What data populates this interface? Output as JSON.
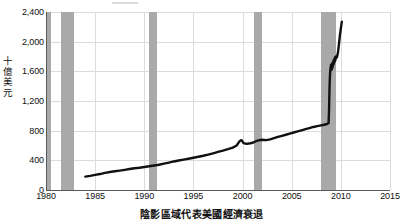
{
  "chart_data": {
    "type": "line",
    "title": "",
    "subtitle": "",
    "xlabel": "",
    "ylabel": "十億美元",
    "caption": "陰影區域代表美國經濟衰退",
    "legend_label": "",
    "legend_position": "top",
    "grid": true,
    "xlim": [
      1980,
      2015
    ],
    "ylim": [
      0,
      2400
    ],
    "xticks": [
      "1980",
      "1985",
      "1990",
      "1995",
      "2000",
      "2005",
      "2010",
      "2015"
    ],
    "xtick_values": [
      1980,
      1985,
      1990,
      1995,
      2000,
      2005,
      2010,
      2015
    ],
    "yticks": [
      "0",
      "400",
      "800",
      "1,200",
      "1,600",
      "2,000",
      "2,400"
    ],
    "ytick_values": [
      0,
      400,
      800,
      1200,
      1600,
      2000,
      2400
    ],
    "series": [
      {
        "name": "",
        "color": "#111111",
        "points": [
          [
            1984.0,
            180
          ],
          [
            1984.5,
            190
          ],
          [
            1985.0,
            203
          ],
          [
            1985.5,
            215
          ],
          [
            1986.0,
            230
          ],
          [
            1986.5,
            243
          ],
          [
            1987.0,
            253
          ],
          [
            1987.5,
            262
          ],
          [
            1988.0,
            272
          ],
          [
            1988.5,
            283
          ],
          [
            1989.0,
            293
          ],
          [
            1989.5,
            300
          ],
          [
            1990.0,
            310
          ],
          [
            1990.5,
            320
          ],
          [
            1991.0,
            330
          ],
          [
            1991.5,
            340
          ],
          [
            1992.0,
            355
          ],
          [
            1992.5,
            370
          ],
          [
            1993.0,
            385
          ],
          [
            1993.5,
            398
          ],
          [
            1994.0,
            410
          ],
          [
            1994.5,
            422
          ],
          [
            1995.0,
            435
          ],
          [
            1995.5,
            448
          ],
          [
            1996.0,
            462
          ],
          [
            1996.5,
            478
          ],
          [
            1997.0,
            495
          ],
          [
            1997.5,
            513
          ],
          [
            1998.0,
            530
          ],
          [
            1998.5,
            550
          ],
          [
            1999.0,
            572
          ],
          [
            1999.4,
            600
          ],
          [
            1999.7,
            660
          ],
          [
            1999.9,
            672
          ],
          [
            2000.1,
            632
          ],
          [
            2000.4,
            622
          ],
          [
            2000.8,
            630
          ],
          [
            2001.1,
            640
          ],
          [
            2001.4,
            660
          ],
          [
            2001.7,
            672
          ],
          [
            2002.0,
            678
          ],
          [
            2002.4,
            672
          ],
          [
            2002.8,
            683
          ],
          [
            2003.2,
            700
          ],
          [
            2003.6,
            716
          ],
          [
            2004.0,
            730
          ],
          [
            2004.4,
            745
          ],
          [
            2004.8,
            760
          ],
          [
            2005.2,
            775
          ],
          [
            2005.6,
            790
          ],
          [
            2006.0,
            805
          ],
          [
            2006.4,
            820
          ],
          [
            2006.8,
            835
          ],
          [
            2007.2,
            850
          ],
          [
            2007.6,
            862
          ],
          [
            2008.0,
            872
          ],
          [
            2008.3,
            880
          ],
          [
            2008.6,
            890
          ],
          [
            2008.75,
            900
          ],
          [
            2008.8,
            1080
          ],
          [
            2008.85,
            1400
          ],
          [
            2008.9,
            1570
          ],
          [
            2008.95,
            1640
          ],
          [
            2009.0,
            1690
          ],
          [
            2009.05,
            1620
          ],
          [
            2009.1,
            1700
          ],
          [
            2009.15,
            1650
          ],
          [
            2009.2,
            1730
          ],
          [
            2009.25,
            1690
          ],
          [
            2009.3,
            1760
          ],
          [
            2009.35,
            1720
          ],
          [
            2009.4,
            1790
          ],
          [
            2009.45,
            1750
          ],
          [
            2009.5,
            1800
          ],
          [
            2009.6,
            1790
          ],
          [
            2009.7,
            1850
          ],
          [
            2009.8,
            1960
          ],
          [
            2009.9,
            2080
          ],
          [
            2010.0,
            2180
          ],
          [
            2010.1,
            2270
          ]
        ]
      }
    ],
    "recession_bands": [
      {
        "label": "1980",
        "start": 1980.0,
        "end": 1980.55
      },
      {
        "label": "1981-1982",
        "start": 1981.55,
        "end": 1982.9
      },
      {
        "label": "1990-1991",
        "start": 1990.5,
        "end": 1991.25
      },
      {
        "label": "2001",
        "start": 2001.2,
        "end": 2001.95
      },
      {
        "label": "2007-2009",
        "start": 2007.95,
        "end": 2009.5
      }
    ],
    "colors": {
      "line": "#111111",
      "recession_band": "#a9a9a9",
      "gridline": "#dcdcdc",
      "axis": "#595959",
      "background": "#ffffff",
      "text": "#111111"
    }
  }
}
